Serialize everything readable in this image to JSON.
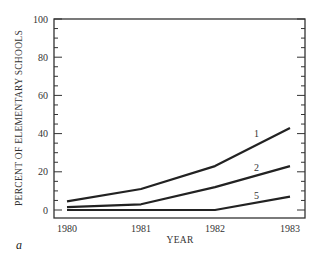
{
  "panel_label": "a",
  "chart_data": {
    "type": "line",
    "title": "",
    "xlabel": "YEAR",
    "ylabel": "PERCENT OF ELEMENTARY SCHOOLS",
    "x": [
      1980,
      1981,
      1982,
      1983
    ],
    "x_tick_labels": [
      "1980",
      "1981",
      "1982",
      "1983"
    ],
    "ylim": [
      0,
      100
    ],
    "y_major_ticks": [
      0,
      20,
      40,
      60,
      80,
      100
    ],
    "y_tick_labels": [
      "0",
      "20",
      "40",
      "60",
      "80",
      "100"
    ],
    "y_minor_step": 5,
    "grid": false,
    "legend": "inline labels at right end of lines",
    "series": [
      {
        "name": "1",
        "values": [
          4.5,
          11,
          23,
          43
        ]
      },
      {
        "name": "2",
        "values": [
          1.5,
          3,
          12,
          23
        ]
      },
      {
        "name": "5",
        "values": [
          0,
          0,
          0,
          7
        ]
      }
    ],
    "line_color": "#222222"
  }
}
